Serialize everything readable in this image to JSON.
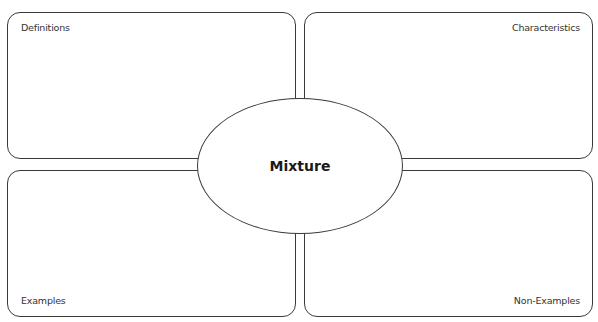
{
  "diagram": {
    "type": "frayer-model",
    "center": {
      "term": "Mixture"
    },
    "quadrants": [
      {
        "position": "top-left",
        "label": "Definitions"
      },
      {
        "position": "top-right",
        "label": "Characteristics"
      },
      {
        "position": "bottom-left",
        "label": "Examples"
      },
      {
        "position": "bottom-right",
        "label": "Non-Examples"
      }
    ]
  }
}
